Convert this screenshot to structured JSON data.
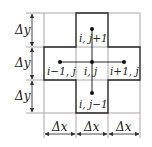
{
  "diagram": {
    "type": "five-point finite difference stencil",
    "grid": {
      "columns": 3,
      "rows": 3
    },
    "nodes": {
      "center": "i, j",
      "top": "i, j+1",
      "bottom": "i, j−1",
      "left": "i−1, j",
      "right": "i+1, j"
    },
    "dimensions": {
      "dy_labels": [
        "Δy",
        "Δy",
        "Δy"
      ],
      "dx_labels": [
        "Δx",
        "Δx",
        "Δx"
      ]
    },
    "colors": {
      "grid_light": "#a0a0a0",
      "stencil_dark": "#2a2a2a",
      "node": "#111111"
    }
  }
}
